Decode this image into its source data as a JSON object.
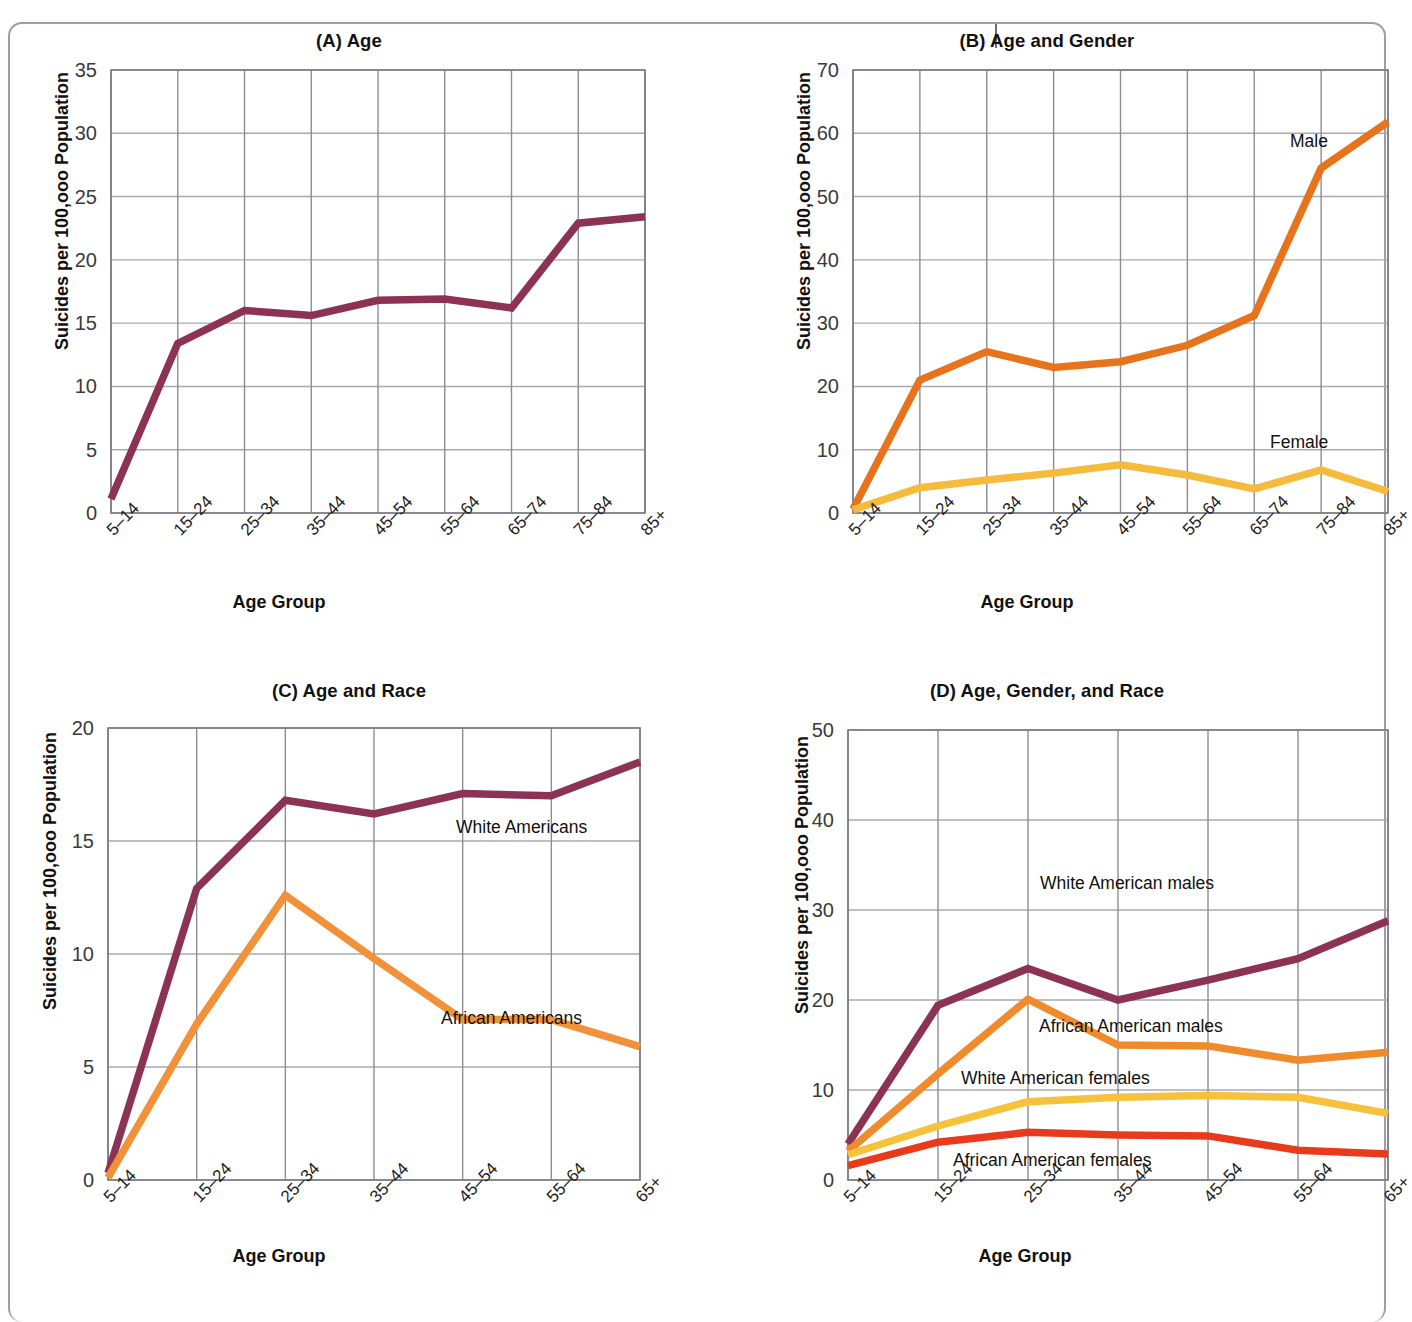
{
  "figure": {
    "ylabel": "Suicides per 100,ooo Population",
    "xlabel": "Age Group"
  },
  "chart_data": [
    {
      "panel": "A",
      "type": "line",
      "title": "(A) Age",
      "xlabel": "Age Group",
      "ylabel": "Suicides per 100,ooo Population",
      "categories": [
        "5–14",
        "15–24",
        "25–34",
        "35–44",
        "45–54",
        "55–64",
        "65–74",
        "75–84",
        "85+"
      ],
      "ylim": [
        0,
        35
      ],
      "yticks": [
        0,
        5,
        10,
        15,
        20,
        25,
        30,
        35
      ],
      "grid": true,
      "legend": "none",
      "series": [
        {
          "name": "All",
          "color": "#8c3253",
          "values": [
            1.1,
            13.4,
            16.0,
            15.6,
            16.8,
            16.9,
            16.2,
            22.9,
            23.4
          ]
        }
      ]
    },
    {
      "panel": "B",
      "type": "line",
      "title": "(B) Age and Gender",
      "xlabel": "Age Group",
      "ylabel": "Suicides per 100,ooo Population",
      "categories": [
        "5–14",
        "15–24",
        "25–34",
        "35–44",
        "45–54",
        "55–64",
        "65–74",
        "75–84",
        "85+"
      ],
      "ylim": [
        0,
        70
      ],
      "yticks": [
        0,
        10,
        20,
        30,
        40,
        50,
        60,
        70
      ],
      "grid": true,
      "legend": "inline-annotations",
      "series": [
        {
          "name": "Male",
          "label": "Male",
          "color": "#e8731d",
          "values": [
            0.6,
            21.0,
            25.5,
            23.0,
            23.9,
            26.5,
            31.2,
            54.5,
            61.8
          ]
        },
        {
          "name": "Female",
          "label": "Female",
          "color": "#f5bb3d",
          "values": [
            0.5,
            4.0,
            5.2,
            6.3,
            7.6,
            6.0,
            3.8,
            6.8,
            3.4
          ]
        }
      ]
    },
    {
      "panel": "C",
      "type": "line",
      "title": "(C) Age and Race",
      "xlabel": "Age Group",
      "ylabel": "Suicides per 100,ooo Population",
      "categories": [
        "5–14",
        "15–24",
        "25–34",
        "35–44",
        "45–54",
        "55–64",
        "65+"
      ],
      "ylim": [
        0,
        20
      ],
      "yticks": [
        0,
        5,
        10,
        15,
        20
      ],
      "grid": true,
      "legend": "inline-annotations",
      "series": [
        {
          "name": "White Americans",
          "label": "White Americans",
          "color": "#8c3253",
          "values": [
            0.3,
            12.9,
            16.8,
            16.2,
            17.1,
            17.0,
            18.5
          ]
        },
        {
          "name": "African Americans",
          "label": "African Americans",
          "color": "#f19139",
          "values": [
            0.1,
            6.9,
            12.6,
            9.8,
            7.1,
            7.1,
            5.9
          ]
        }
      ]
    },
    {
      "panel": "D",
      "type": "line",
      "title": "(D) Age, Gender, and Race",
      "xlabel": "Age Group",
      "ylabel": "Suicides per 100,ooo Population",
      "categories": [
        "5–14",
        "15–24",
        "25–34",
        "35–44",
        "45–54",
        "55–64",
        "65+"
      ],
      "ylim": [
        0,
        50
      ],
      "yticks": [
        0,
        10,
        20,
        30,
        40,
        50
      ],
      "grid": true,
      "legend": "inline-annotations",
      "series": [
        {
          "name": "White American males",
          "label": "White American males",
          "color": "#8c3253",
          "values": [
            4.0,
            19.4,
            23.5,
            20.0,
            22.2,
            24.6,
            28.8
          ]
        },
        {
          "name": "African American males",
          "label": "African American males",
          "color": "#f08b2c",
          "values": [
            3.2,
            11.8,
            20.1,
            15.0,
            14.9,
            13.3,
            14.2
          ]
        },
        {
          "name": "White American females",
          "label": "White American females",
          "color": "#f6c23c",
          "values": [
            2.8,
            6.0,
            8.7,
            9.2,
            9.4,
            9.2,
            7.4
          ]
        },
        {
          "name": "African American females",
          "label": "African American females",
          "color": "#e83b1b",
          "values": [
            1.6,
            4.2,
            5.3,
            5.0,
            4.9,
            3.3,
            2.9
          ]
        }
      ]
    }
  ],
  "annotations": {
    "a_title": "(A) Age",
    "b_title": "(B) Age and Gender",
    "c_title": "(C) Age and Race",
    "d_title": "(D) Age, Gender, and Race",
    "b_male": "Male",
    "b_female": "Female",
    "c_white": "White Americans",
    "c_african": "African Americans",
    "d_wam": "White American males",
    "d_aam": "African American males",
    "d_waf": "White American females",
    "d_aaf": "African American females"
  }
}
